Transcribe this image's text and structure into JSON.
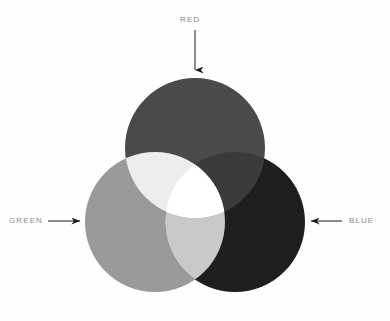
{
  "diagram": {
    "kind": "additive-color-mixing-venn",
    "background_color": "#fefefe",
    "labels": {
      "red": "RED",
      "green": "GREEN",
      "blue": "BLUE"
    },
    "annotations": [
      {
        "name": "red-callout",
        "text": "RED",
        "arrow_direction": "down",
        "label_x": 195,
        "label_y": 20,
        "arrow_from": [
          195,
          30
        ],
        "arrow_to": [
          195,
          74
        ]
      },
      {
        "name": "green-callout",
        "text": "GREEN",
        "arrow_direction": "right",
        "label_x": 30,
        "label_y": 221,
        "arrow_from": [
          48,
          221
        ],
        "arrow_to": [
          84,
          221
        ]
      },
      {
        "name": "blue-callout",
        "text": "BLUE",
        "arrow_direction": "left",
        "label_x": 360,
        "label_y": 221,
        "arrow_from": [
          342,
          221
        ],
        "arrow_to": [
          307,
          221
        ]
      }
    ],
    "arrow_color": "#1a1a1a",
    "label_color": "#8a8a8a"
  },
  "chart_data": {
    "type": "venn",
    "title": "",
    "subtitle": "",
    "xlabel": "",
    "ylabel": "",
    "grid": false,
    "legend_position": "callout-arrows",
    "sets": [
      {
        "name": "RED",
        "label": "RED",
        "center_x": 195,
        "center_y": 148,
        "radius": 70,
        "fill": "#4a4a4a"
      },
      {
        "name": "GREEN",
        "label": "GREEN",
        "center_x": 155,
        "center_y": 222,
        "radius": 70,
        "fill": "#9a9a9a"
      },
      {
        "name": "BLUE",
        "label": "BLUE",
        "center_x": 235,
        "center_y": 222,
        "radius": 70,
        "fill": "#1e1e1e"
      }
    ],
    "intersections": [
      {
        "name": "RED+GREEN",
        "mix": "yellow",
        "fill": "#ededed"
      },
      {
        "name": "GREEN+BLUE",
        "mix": "cyan",
        "fill": "#c9c9c9"
      },
      {
        "name": "RED+BLUE",
        "mix": "magenta",
        "fill": "#3a3a3a"
      },
      {
        "name": "RED+GREEN+BLUE",
        "mix": "white",
        "fill": "#ffffff"
      }
    ]
  }
}
